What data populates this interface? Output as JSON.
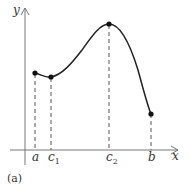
{
  "figure": {
    "caption": "(a)",
    "axes": {
      "x_label": "x",
      "y_label": "y"
    },
    "points": [
      {
        "id": "a",
        "label": "a",
        "sub": ""
      },
      {
        "id": "c1",
        "label": "c",
        "sub": "1"
      },
      {
        "id": "c2",
        "label": "c",
        "sub": "2"
      },
      {
        "id": "b",
        "label": "b",
        "sub": ""
      }
    ],
    "colors": {
      "curve": "#222222",
      "axis": "#666666",
      "dashed": "#555555"
    }
  }
}
